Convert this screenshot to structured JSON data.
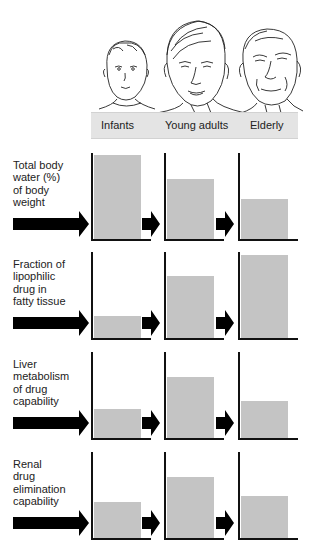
{
  "header": {
    "groups": [
      "Infants",
      "Young adults",
      "Elderly"
    ],
    "band_color": "#e4e4e4",
    "illustration": [
      "infant-face-icon",
      "young-adult-face-icon",
      "elderly-face-icon"
    ]
  },
  "rows": [
    {
      "label": "Total body water (%) of body weight",
      "lines": [
        "Total body",
        "water (%)",
        "of body",
        "weight"
      ]
    },
    {
      "label": "Fraction of lipophilic drug in fatty tissue",
      "lines": [
        "Fraction of",
        "lipophilic",
        "drug in",
        "fatty tissue"
      ]
    },
    {
      "label": "Liver metabolism of drug capability",
      "lines": [
        "Liver",
        "metabolism",
        "of drug",
        "capability"
      ]
    },
    {
      "label": "Renal drug elimination capability",
      "lines": [
        "Renal",
        "drug",
        "elimination",
        "capability"
      ]
    }
  ],
  "colors": {
    "bar": "#c4c4c4",
    "axis": "#111111",
    "arrow": "#000000"
  },
  "chart_data": {
    "type": "bar",
    "title": "",
    "categories": [
      "Infants",
      "Young adults",
      "Elderly"
    ],
    "xlabel": "",
    "ylabel": "Relative level (% of panel height, unitless)",
    "ylim": [
      0,
      100
    ],
    "grid": false,
    "series": [
      {
        "name": "Total body water (%) of body weight",
        "values": [
          98,
          70,
          47
        ]
      },
      {
        "name": "Fraction of lipophilic drug in fatty tissue",
        "values": [
          26,
          72,
          97
        ]
      },
      {
        "name": "Liver metabolism of drug capability",
        "values": [
          34,
          71,
          43
        ]
      },
      {
        "name": "Renal drug elimination capability",
        "values": [
          42,
          71,
          49
        ]
      }
    ]
  }
}
